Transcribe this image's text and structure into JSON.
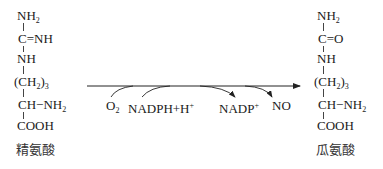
{
  "reactant": {
    "name": "精氨酸",
    "rows": {
      "r1": {
        "a": "NH",
        "b": "2"
      },
      "r2": "C=NH",
      "r3": "NH",
      "r4": {
        "a": "(CH",
        "b": "2",
        "c": ")",
        "d": "3"
      },
      "r5": {
        "a": "CH−NH",
        "b": "2"
      },
      "r6": "COOH"
    }
  },
  "product": {
    "name": "瓜氨酸",
    "rows": {
      "r1": {
        "a": "NH",
        "b": "2"
      },
      "r2": "C=O",
      "r3": "NH",
      "r4": {
        "a": "(CH",
        "b": "2",
        "c": ")",
        "d": "3"
      },
      "r5": {
        "a": "CH−NH",
        "b": "2"
      },
      "r6": "COOH"
    }
  },
  "reaction": {
    "inputs": [
      {
        "a": "O",
        "b": "2"
      },
      {
        "a": "NADPH+H",
        "sup": "+"
      }
    ],
    "outputs": [
      {
        "a": "NADP",
        "sup": "+"
      },
      {
        "a": "NO"
      }
    ]
  }
}
